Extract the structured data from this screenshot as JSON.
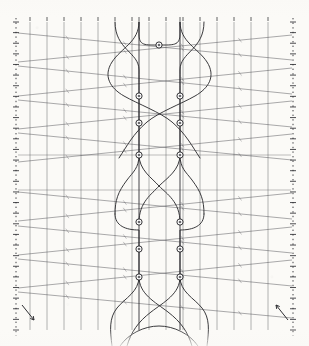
{
  "figure": {
    "title": "braid-diagram",
    "description": "Scanned technical line diagram: braid / knot projection over a ruled grid",
    "background_color": "#fbfaf7",
    "ink_color": "#3a3a3c",
    "grid_color": "#5a5a5e",
    "strand_color": "#2f2f33",
    "node_fill": "#6a6a6e",
    "node_stroke": "#1f1f22",
    "canvas": {
      "width": 309,
      "height": 346
    }
  },
  "frame": {
    "left_axis_x": 16,
    "right_axis_x": 293,
    "top_y": 22,
    "bottom_y": 330,
    "axis_style": "dashed-ticked"
  },
  "grid": {
    "vertical_lines_x": [
      30,
      47,
      64,
      81,
      98,
      115,
      132,
      149,
      166,
      183,
      200,
      217,
      234,
      251,
      268
    ],
    "strand_rail_x": [
      139,
      180
    ],
    "horizontal_band_y": [
      34,
      55,
      66,
      84,
      95,
      110,
      122,
      133,
      148,
      160,
      178,
      190,
      205,
      216,
      232,
      244,
      260,
      272,
      288,
      300,
      316
    ],
    "tick_count_top": 15,
    "tick_count_left": 30,
    "tick_count_right": 30
  },
  "nodes": {
    "radius": 3.1,
    "inner_radius": 1.35,
    "points": [
      {
        "id": "n-top",
        "x": 159,
        "y": 45,
        "label": "apex-node"
      },
      {
        "id": "n-l1",
        "x": 139,
        "y": 96,
        "label": "left-upper-1"
      },
      {
        "id": "n-l2",
        "x": 139,
        "y": 123,
        "label": "left-upper-2"
      },
      {
        "id": "n-l3",
        "x": 139,
        "y": 155,
        "label": "left-upper-3"
      },
      {
        "id": "n-r1",
        "x": 180,
        "y": 96,
        "label": "right-upper-1"
      },
      {
        "id": "n-r2",
        "x": 180,
        "y": 123,
        "label": "right-upper-2"
      },
      {
        "id": "n-r3",
        "x": 180,
        "y": 155,
        "label": "right-upper-3"
      },
      {
        "id": "n-l4",
        "x": 139,
        "y": 222,
        "label": "left-lower-1"
      },
      {
        "id": "n-l5",
        "x": 139,
        "y": 249,
        "label": "left-lower-2"
      },
      {
        "id": "n-l6",
        "x": 139,
        "y": 277,
        "label": "left-lower-3"
      },
      {
        "id": "n-r4",
        "x": 180,
        "y": 222,
        "label": "right-lower-1"
      },
      {
        "id": "n-r5",
        "x": 180,
        "y": 249,
        "label": "right-lower-2"
      },
      {
        "id": "n-r6",
        "x": 180,
        "y": 277,
        "label": "right-lower-3"
      }
    ]
  },
  "slant_lines": [
    {
      "x1": 18,
      "y1": 33,
      "x2": 292,
      "y2": 60,
      "name": "slant-1"
    },
    {
      "x1": 18,
      "y1": 62,
      "x2": 292,
      "y2": 35,
      "name": "slant-2"
    },
    {
      "x1": 18,
      "y1": 66,
      "x2": 292,
      "y2": 94,
      "name": "slant-3"
    },
    {
      "x1": 18,
      "y1": 96,
      "x2": 292,
      "y2": 68,
      "name": "slant-4"
    },
    {
      "x1": 18,
      "y1": 100,
      "x2": 292,
      "y2": 127,
      "name": "slant-5"
    },
    {
      "x1": 18,
      "y1": 129,
      "x2": 292,
      "y2": 101,
      "name": "slant-6"
    },
    {
      "x1": 18,
      "y1": 133,
      "x2": 292,
      "y2": 160,
      "name": "slant-7"
    },
    {
      "x1": 18,
      "y1": 162,
      "x2": 292,
      "y2": 134,
      "name": "slant-8"
    },
    {
      "x1": 18,
      "y1": 192,
      "x2": 292,
      "y2": 219,
      "name": "slant-9"
    },
    {
      "x1": 18,
      "y1": 221,
      "x2": 292,
      "y2": 193,
      "name": "slant-10"
    },
    {
      "x1": 18,
      "y1": 226,
      "x2": 292,
      "y2": 253,
      "name": "slant-11"
    },
    {
      "x1": 18,
      "y1": 255,
      "x2": 292,
      "y2": 227,
      "name": "slant-12"
    },
    {
      "x1": 18,
      "y1": 259,
      "x2": 292,
      "y2": 286,
      "name": "slant-13"
    },
    {
      "x1": 18,
      "y1": 288,
      "x2": 292,
      "y2": 260,
      "name": "slant-14"
    },
    {
      "x1": 18,
      "y1": 292,
      "x2": 292,
      "y2": 318,
      "name": "slant-15"
    }
  ],
  "near_horizontal_lines": [
    {
      "y": 155,
      "name": "mid-rule-1"
    },
    {
      "y": 190,
      "name": "mid-rule-2"
    }
  ],
  "strands": [
    {
      "name": "strand-a",
      "d": "M 139,22 L 139,34 C 139,46 145,45 159,45 C 173,45 180,46 180,34 L 180,22"
    },
    {
      "name": "strand-b",
      "d": "M 115,22 C 115,50 139,52 139,70 C 139,84 139,88 139,96 L 139,155 C 139,168 133,172 127,180 C 118,192 115,200 115,214"
    },
    {
      "name": "strand-c",
      "d": "M 204,22 C 204,50 180,52 180,70 C 180,84 180,88 180,96 L 180,155 C 180,168 186,172 192,180 C 201,192 204,200 204,214"
    },
    {
      "name": "strand-d",
      "d": "M 139,22 C 139,42 121,48 112,62 C 103,76 110,88 124,96 C 138,104 160,112 172,122 C 186,134 192,146 200,158"
    },
    {
      "name": "strand-e",
      "d": "M 180,22 C 180,42 198,48 207,62 C 216,76 209,88 195,96 C 181,104 159,112 147,122 C 133,134 127,146 119,158"
    },
    {
      "name": "strand-f",
      "d": "M 139,155 C 139,170 152,178 159,186 C 167,194 180,202 180,222"
    },
    {
      "name": "strand-g",
      "d": "M 180,155 C 180,170 167,178 159,186 C 152,194 139,202 139,222"
    },
    {
      "name": "strand-h",
      "d": "M 115,214 C 115,226 126,230 139,230 L 139,277"
    },
    {
      "name": "strand-i",
      "d": "M 204,214 C 204,226 193,230 180,230 L 180,277"
    },
    {
      "name": "strand-j",
      "d": "M 139,277 C 139,292 125,298 117,308 C 109,318 110,330 112,346"
    },
    {
      "name": "strand-k",
      "d": "M 180,277 C 180,292 194,298 202,308 C 210,318 209,330 207,346"
    },
    {
      "name": "strand-l",
      "d": "M 139,277 C 139,294 155,302 168,312 C 181,322 188,332 192,346"
    },
    {
      "name": "strand-m",
      "d": "M 180,277 C 180,294 164,302 151,312 C 138,322 131,332 127,346"
    },
    {
      "name": "strand-n",
      "d": "M 120,346 C 128,334 144,326 159,326 C 174,326 190,334 198,346"
    }
  ],
  "corner_marks": [
    {
      "name": "arrow-bottom-left",
      "x1": 22,
      "y1": 305,
      "x2": 34,
      "y2": 320
    },
    {
      "name": "arrow-bottom-right",
      "x1": 288,
      "y1": 320,
      "x2": 276,
      "y2": 305
    }
  ]
}
